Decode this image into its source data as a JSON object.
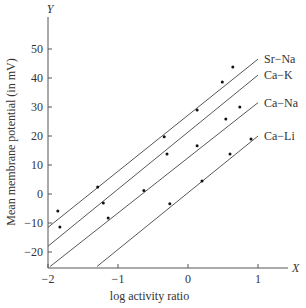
{
  "chart_data": {
    "type": "scatter",
    "title": "",
    "xlabel": "log activity ratio",
    "ylabel": "Mean membrane potential (in mV)",
    "x_axis_letter": "X",
    "y_axis_letter": "Y",
    "xlim": [
      -2,
      1.3
    ],
    "ylim": [
      -25,
      58
    ],
    "x_ticks": [
      -2,
      -1,
      0,
      1
    ],
    "x_tick_labels": [
      "−2",
      "−1",
      "0",
      "1"
    ],
    "y_ticks": [
      -20,
      -10,
      0,
      10,
      20,
      30,
      40,
      50
    ],
    "y_tick_labels": [
      "−20",
      "−10",
      "0",
      "10",
      "20",
      "30",
      "40",
      "50"
    ],
    "grid": false,
    "legend_position": "line-end labels",
    "series": [
      {
        "name": "Sr−Na",
        "line": {
          "x0": -2.0,
          "y0": -11.5,
          "x1": 1.0,
          "y1": 46.5
        },
        "points": [
          [
            -1.86,
            -5.9
          ],
          [
            -1.29,
            2.4
          ],
          [
            0.13,
            29.0
          ],
          [
            0.64,
            43.8
          ]
        ]
      },
      {
        "name": "Ca−K",
        "line": {
          "x0": -2.0,
          "y0": -18.0,
          "x1": 1.0,
          "y1": 41.0
        },
        "points": [
          [
            -1.83,
            -11.4
          ],
          [
            -1.21,
            -3.1
          ],
          [
            -0.34,
            19.7
          ],
          [
            0.49,
            38.6
          ]
        ]
      },
      {
        "name": "Ca−Na",
        "line": {
          "x0": -1.97,
          "y0": -25.0,
          "x1": 1.0,
          "y1": 31.5
        },
        "points": [
          [
            -1.14,
            -8.3
          ],
          [
            -0.63,
            1.2
          ],
          [
            -0.3,
            13.8
          ],
          [
            0.13,
            16.6
          ],
          [
            0.54,
            25.9
          ],
          [
            0.74,
            30.0
          ]
        ]
      },
      {
        "name": "Ca−Li",
        "line": {
          "x0": -1.3,
          "y0": -25.0,
          "x1": 1.0,
          "y1": 20.0
        },
        "points": [
          [
            -0.26,
            -3.4
          ],
          [
            0.2,
            4.5
          ],
          [
            0.6,
            13.8
          ],
          [
            0.9,
            19.0
          ]
        ]
      }
    ]
  }
}
